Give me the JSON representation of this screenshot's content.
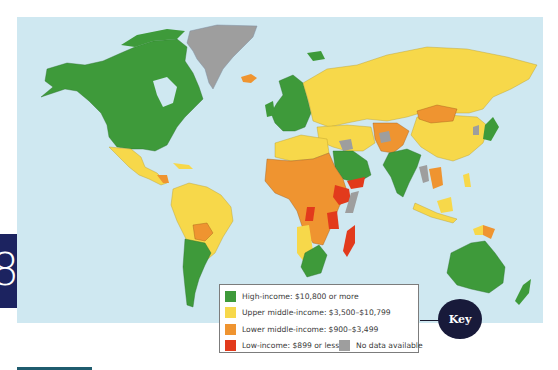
{
  "chapter": {
    "number": "8",
    "color": "#1c2360"
  },
  "map": {
    "title": "World income groups",
    "ocean_color": "#cfe8f1",
    "category_colors": {
      "high": "#3e9a3a",
      "upper_middle": "#f7d84a",
      "lower_middle": "#ef9430",
      "low": "#e23a1c",
      "no_data": "#9e9e9e"
    },
    "regions": [
      {
        "name": "North America (Canada, USA, Alaska)",
        "category": "high"
      },
      {
        "name": "Greenland",
        "category": "no_data"
      },
      {
        "name": "Iceland",
        "category": "lower_middle"
      },
      {
        "name": "Mexico & most of Latin America",
        "category": "upper_middle"
      },
      {
        "name": "Bolivia",
        "category": "lower_middle"
      },
      {
        "name": "Argentina & Chile",
        "category": "high"
      },
      {
        "name": "Western Europe",
        "category": "high"
      },
      {
        "name": "Russia & Eastern Europe",
        "category": "upper_middle"
      },
      {
        "name": "Mongolia",
        "category": "lower_middle"
      },
      {
        "name": "China",
        "category": "upper_middle"
      },
      {
        "name": "India",
        "category": "high"
      },
      {
        "name": "Pakistan / Central Asia",
        "category": "lower_middle"
      },
      {
        "name": "Saudi Arabia",
        "category": "high"
      },
      {
        "name": "Yemen / Ethiopia / East Africa",
        "category": "low"
      },
      {
        "name": "Sub-Saharan Africa",
        "category": "lower_middle"
      },
      {
        "name": "Southern Africa",
        "category": "high"
      },
      {
        "name": "Madagascar",
        "category": "low"
      },
      {
        "name": "Japan",
        "category": "high"
      },
      {
        "name": "Southeast Asia / Indonesia",
        "category": "upper_middle"
      },
      {
        "name": "Papua New Guinea",
        "category": "lower_middle"
      },
      {
        "name": "Australia & New Zealand",
        "category": "high"
      }
    ]
  },
  "legend": {
    "items": [
      {
        "id": "high",
        "label": "High-income: $10,800 or more",
        "color": "#3e9a3a"
      },
      {
        "id": "upper_middle",
        "label": "Upper middle-income: $3,500–$10,799",
        "color": "#f7d84a"
      },
      {
        "id": "lower_middle",
        "label": "Lower middle-income: $900–$3,499",
        "color": "#ef9430"
      },
      {
        "id": "low",
        "label": "Low-income: $899 or less",
        "color": "#e23a1c"
      },
      {
        "id": "no_data",
        "label": "No data available",
        "color": "#9e9e9e"
      }
    ]
  },
  "key_badge": {
    "label": "Key",
    "color": "#181a3a"
  }
}
